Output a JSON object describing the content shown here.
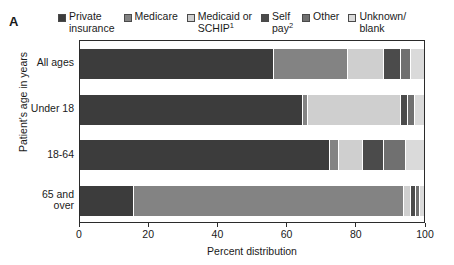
{
  "panel": {
    "letter": "A"
  },
  "legend": {
    "items": [
      {
        "label": "Private\ninsurance",
        "color": "#3c3c3c",
        "name": "private-insurance"
      },
      {
        "label": "Medicare",
        "color": "#838383",
        "name": "medicare"
      },
      {
        "label": "Medicaid or\nSCHIP",
        "sup": "1",
        "color": "#cfcfcf",
        "name": "medicaid-or-schip"
      },
      {
        "label": "Self\npay",
        "sup": "2",
        "color": "#4b4b4b",
        "name": "self-pay"
      },
      {
        "label": "Other",
        "color": "#707070",
        "name": "other"
      },
      {
        "label": "Unknown/\nblank",
        "color": "#dadada",
        "name": "unknown-blank"
      }
    ]
  },
  "axes": {
    "y_title": "Patient's age in years",
    "x_title": "Percent distribution",
    "x_ticks": [
      "0",
      "20",
      "40",
      "60",
      "80",
      "100"
    ]
  },
  "chart_data": {
    "type": "bar",
    "orientation": "horizontal",
    "stacked": true,
    "normalized": true,
    "title": "",
    "panel_label": "A",
    "xlabel": "Percent distribution",
    "ylabel": "Patient's age in years",
    "xlim": [
      0,
      100
    ],
    "xticks": [
      0,
      20,
      40,
      60,
      80,
      100
    ],
    "grid": false,
    "legend_position": "top",
    "categories": [
      "All ages",
      "Under 18",
      "18-64",
      "65 and over"
    ],
    "series": [
      {
        "name": "Private insurance",
        "color": "#3c3c3c",
        "values": [
          56.0,
          64.5,
          72.5,
          15.5
        ]
      },
      {
        "name": "Medicare",
        "color": "#838383",
        "values": [
          21.5,
          1.5,
          2.5,
          78.5
        ]
      },
      {
        "name": "Medicaid or SCHIP",
        "color": "#cfcfcf",
        "values": [
          10.5,
          27.0,
          7.0,
          2.0
        ]
      },
      {
        "name": "Self pay",
        "color": "#4b4b4b",
        "values": [
          5.0,
          2.0,
          6.0,
          1.5
        ]
      },
      {
        "name": "Other",
        "color": "#707070",
        "values": [
          3.0,
          2.0,
          6.5,
          1.0
        ]
      },
      {
        "name": "Unknown/blank",
        "color": "#dadada",
        "values": [
          4.0,
          3.0,
          5.5,
          1.5
        ]
      }
    ]
  }
}
